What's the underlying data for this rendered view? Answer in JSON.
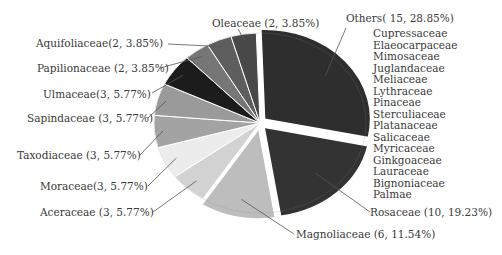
{
  "chart_data": {
    "type": "pie",
    "title": "",
    "total": 52,
    "slices": [
      {
        "name": "Others",
        "count": 15,
        "percent": 28.85,
        "label": "Others( 15, 28.85%)",
        "color": "#2e2e2e",
        "exploded": true
      },
      {
        "name": "Rosaceae",
        "count": 10,
        "percent": 19.23,
        "label": "Rosaceae (10, 19.23%)",
        "color": "#333333",
        "exploded": true
      },
      {
        "name": "Magnoliaceae",
        "count": 6,
        "percent": 11.54,
        "label": "Magnoliaceae (6, 11.54%)",
        "color": "#bdbdbd",
        "exploded": true
      },
      {
        "name": "Aceraceae",
        "count": 3,
        "percent": 5.77,
        "label": "Aceraceae (3, 5.77%)",
        "color": "#d2d2d2",
        "exploded": false
      },
      {
        "name": "Moraceae",
        "count": 3,
        "percent": 5.77,
        "label": "Moraceae(3, 5.77%)",
        "color": "#ececec",
        "exploded": false
      },
      {
        "name": "Taxodiaceae",
        "count": 3,
        "percent": 5.77,
        "label": "Taxodiaceae (3, 5.77%)",
        "color": "#a3a3a3",
        "exploded": false
      },
      {
        "name": "Sapindaceae",
        "count": 3,
        "percent": 5.77,
        "label": "Sapindaceae (3, 5.77%)",
        "color": "#9a9a9a",
        "exploded": false
      },
      {
        "name": "Ulmaceae",
        "count": 3,
        "percent": 5.77,
        "label": "Ulmaceae(3, 5.77%)",
        "color": "#1c1c1c",
        "exploded": false
      },
      {
        "name": "Papilionaceae",
        "count": 2,
        "percent": 3.85,
        "label": "Papilionaceae (2, 3.85%)",
        "color": "#767676",
        "exploded": false
      },
      {
        "name": "Aquifoliaceae",
        "count": 2,
        "percent": 3.85,
        "label": "Aquifoliaceae(2, 3.85%)",
        "color": "#5e5e5e",
        "exploded": false
      },
      {
        "name": "Oleaceae",
        "count": 2,
        "percent": 3.85,
        "label": "Oleaceae (2, 3.85%)",
        "color": "#484848",
        "exploded": false
      }
    ],
    "others_members": [
      "Cupressaceae",
      "Elaeocarpaceae",
      "Mimosaceae",
      "Juglandaceae",
      "Meliaceae",
      "Lythraceae",
      "Pinaceae",
      "Sterculiaceae",
      "Platanaceae",
      "Salicaceae",
      "Myricaceae",
      "Ginkgoaceae",
      "Lauraceae",
      "Bignoniaceae",
      "Palmae"
    ],
    "legend": "none (callout labels with leader lines)"
  }
}
